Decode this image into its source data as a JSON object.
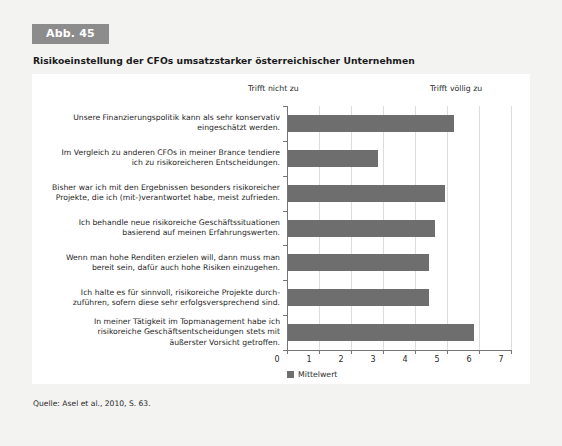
{
  "figure": {
    "tab_label": "Abb. 45",
    "title": "Risikoeinstellung der CFOs umsatzstarker österreichischer Unternehmen",
    "source": "Quelle: Asel et al., 2010, S. 63."
  },
  "annotations": {
    "left_anchor": "Trifft nicht zu",
    "right_anchor": "Trifft völlig zu"
  },
  "legend": {
    "position": "bottom-left",
    "entries": [
      {
        "label": "Mittelwert",
        "color": "#6e6e6e"
      }
    ]
  },
  "colors": {
    "bar": "#6e6e6e",
    "tab_background": "#8c8c8c",
    "page_background": "#f3f3f2",
    "panel_background": "#ffffff",
    "gridline": "#dcdcdc",
    "axis": "#767676"
  },
  "chart_data": {
    "type": "bar",
    "orientation": "horizontal",
    "title": "Risikoeinstellung der CFOs umsatzstarker österreichischer Unternehmen",
    "xlabel": "",
    "ylabel": "",
    "xlim": [
      0,
      7
    ],
    "grid": true,
    "legend_position": "bottom-left",
    "xticks": [
      0,
      1,
      2,
      3,
      4,
      5,
      6,
      7
    ],
    "xtick_labels": [
      "0",
      "1",
      "2",
      "3",
      "4",
      "5",
      "6",
      "7"
    ],
    "series": [
      {
        "name": "Mittelwert",
        "color": "#6e6e6e",
        "values": [
          5.2,
          2.8,
          4.9,
          4.6,
          4.4,
          4.4,
          5.8
        ]
      }
    ],
    "categories": [
      "Unsere Finanzierungspolitik kann als sehr konservativ eingeschätzt werden.",
      "Im Vergleich zu anderen CFOs in meiner Brance tendiere ich zu risikoreicheren Entscheidungen.",
      "Bisher war ich mit den Ergebnissen besonders risikoreicher Projekte, die ich (mit-)verantwortet habe, meist zufrieden.",
      "Ich behandle neue risikoreiche Geschäftssituationen basierend auf meinen Erfahrungswerten.",
      "Wenn man hohe Renditen erzielen will, dann muss man bereit sein, dafür auch hohe Risiken einzugehen.",
      "Ich halte es für sinnvoll, risikoreiche Projekte durch-zuführen, sofern diese sehr erfolgsversprechend sind.",
      "In meiner Tätigkeit im Topmanagement habe ich risikoreiche Geschäftsentscheidungen stets mit äußerster Vorsicht getroffen."
    ],
    "category_lines": [
      [
        "Unsere Finanzierungspolitik kann als sehr konservativ",
        "eingeschätzt werden."
      ],
      [
        "Im Vergleich zu anderen CFOs in meiner Brance tendiere",
        "ich zu risikoreicheren Entscheidungen."
      ],
      [
        "Bisher war ich mit den Ergebnissen besonders risikoreicher",
        "Projekte, die ich (mit-)verantwortet habe, meist zufrieden."
      ],
      [
        "Ich behandle neue risikoreiche Geschäftssituationen",
        "basierend auf meinen Erfahrungswerten."
      ],
      [
        "Wenn man hohe Renditen erzielen will, dann muss man",
        "bereit sein, dafür auch hohe Risiken einzugehen."
      ],
      [
        "Ich halte es für sinnvoll, risikoreiche Projekte durch-",
        "zuführen, sofern diese sehr erfolgsversprechend sind."
      ],
      [
        "In meiner Tätigkeit im Topmanagement habe ich",
        "risikoreiche Geschäftsentscheidungen stets mit",
        "äußerster Vorsicht getroffen."
      ]
    ]
  }
}
